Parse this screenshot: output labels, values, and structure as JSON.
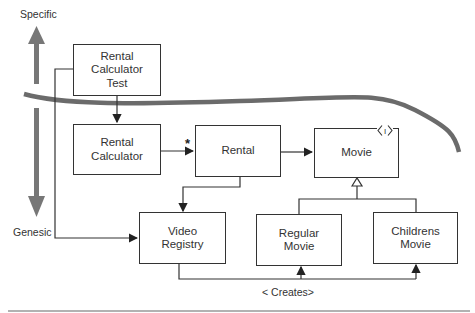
{
  "diagram": {
    "axis": {
      "top_label": "Specific",
      "bottom_label": "Genesic"
    },
    "boxes": [
      {
        "id": "rental-calculator-test",
        "label": "Rental\nCalculator\nTest"
      },
      {
        "id": "rental-calculator",
        "label": "Rental\nCalculator"
      },
      {
        "id": "rental",
        "label": "Rental"
      },
      {
        "id": "movie",
        "label": "Movie",
        "stereotype": "I"
      },
      {
        "id": "video-registry",
        "label": "Video\nRegistry"
      },
      {
        "id": "regular-movie",
        "label": "Regular\nMovie"
      },
      {
        "id": "childrens-movie",
        "label": "Childrens\nMovie"
      }
    ],
    "multiplicity": "*",
    "creates_label": "< Creates>",
    "colors": {
      "line": "#333333",
      "band": "#6b6b6b"
    }
  }
}
